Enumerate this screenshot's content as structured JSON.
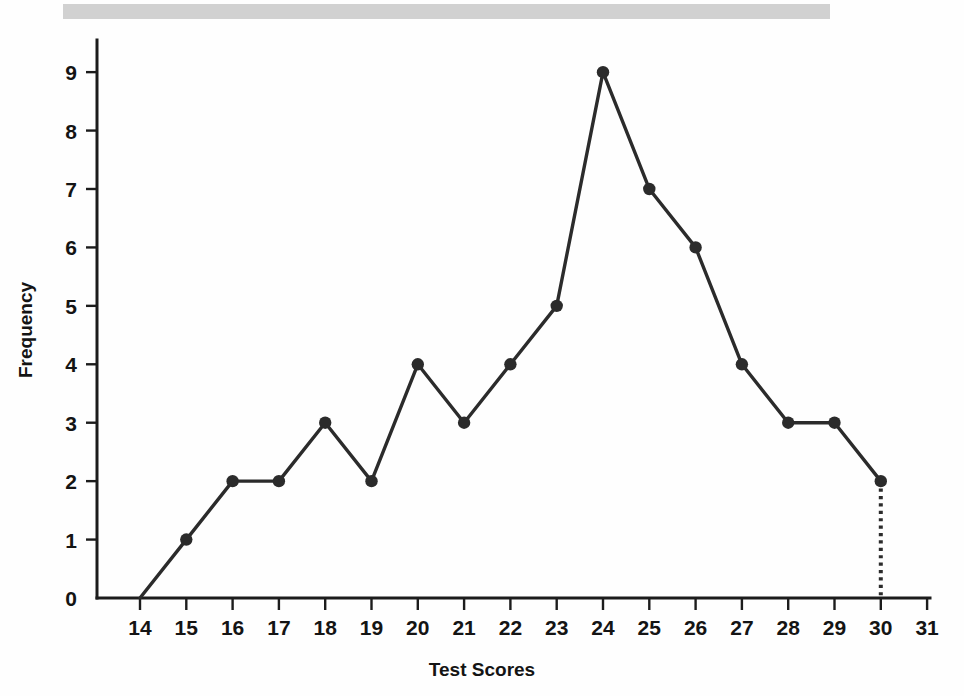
{
  "page": {
    "background_color": "#fefefe",
    "scan_band_color": "#c9c9c9"
  },
  "chart_data": {
    "type": "line",
    "title": "",
    "subtitle": "",
    "xlabel": "Test Scores",
    "ylabel": "Frequency",
    "x": [
      14,
      15,
      16,
      17,
      18,
      19,
      20,
      21,
      22,
      23,
      24,
      25,
      26,
      27,
      28,
      29,
      30
    ],
    "values": [
      0,
      1,
      2,
      2,
      3,
      2,
      4,
      3,
      4,
      5,
      9,
      7,
      6,
      4,
      3,
      3,
      2
    ],
    "series": [
      {
        "name": "Frequency",
        "color": "#2b2b2b",
        "marker": "circle",
        "values": [
          0,
          1,
          2,
          2,
          3,
          2,
          4,
          3,
          4,
          5,
          9,
          7,
          6,
          4,
          3,
          3,
          2
        ]
      }
    ],
    "xtick_labels": [
      "14",
      "15",
      "16",
      "17",
      "18",
      "19",
      "20",
      "21",
      "22",
      "23",
      "24",
      "25",
      "26",
      "27",
      "28",
      "29",
      "30",
      "31"
    ],
    "xticks": [
      14,
      15,
      16,
      17,
      18,
      19,
      20,
      21,
      22,
      23,
      24,
      25,
      26,
      27,
      28,
      29,
      30,
      31
    ],
    "ytick_labels": [
      "0",
      "1",
      "2",
      "3",
      "4",
      "5",
      "6",
      "7",
      "8",
      "9"
    ],
    "yticks": [
      0,
      1,
      2,
      3,
      4,
      5,
      6,
      7,
      8,
      9
    ],
    "xlim": [
      13.1,
      31.9
    ],
    "ylim": [
      0,
      9.55
    ],
    "grid": false,
    "legend": false,
    "legend_position": "none",
    "annotations": [
      {
        "name": "drop-line-at-30",
        "kind": "dotted-vertical",
        "x": 30,
        "y_from": 2,
        "y_to": 0
      }
    ],
    "line_color": "#2b2b2b",
    "axis_color": "#1c1c1c"
  },
  "geometry": {
    "x_origin_px": 97,
    "x_end_px": 930,
    "y_zero_px": 598,
    "y_top_px": 40,
    "x_first_tick_px": 140,
    "x_tick_step_px": 46.3,
    "y_tick_step_px": 66.0,
    "marker_radius_px": 6.2
  }
}
